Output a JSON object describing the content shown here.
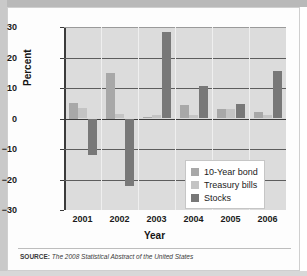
{
  "figure": {
    "source_prefix": "SOURCE:",
    "source_text": "The 2008 Statistical Abstract of the United States"
  },
  "chart_data": {
    "type": "bar",
    "title": "",
    "xlabel": "Year",
    "ylabel": "Percent",
    "categories": [
      "2001",
      "2002",
      "2003",
      "2004",
      "2005",
      "2006"
    ],
    "ylim": [
      -30,
      30
    ],
    "yticks": [
      30,
      20,
      10,
      0,
      -10,
      -20,
      -30
    ],
    "ytick_labels": [
      "30",
      "20",
      "10",
      "0",
      "−10",
      "−20",
      "−30"
    ],
    "grid": true,
    "legend_position": "inside-lower-right",
    "series": [
      {
        "name": "10-Year bond",
        "color": "#a8a8a8",
        "values": [
          5.0,
          15.0,
          0.5,
          4.5,
          3.0,
          2.0
        ]
      },
      {
        "name": "Treasury bills",
        "color": "#c4c4c4",
        "values": [
          3.4,
          1.6,
          1.0,
          1.2,
          3.0,
          1.0
        ]
      },
      {
        "name": "Stocks",
        "color": "#787878",
        "values": [
          -12.0,
          -22.2,
          28.5,
          10.8,
          4.8,
          15.5
        ]
      }
    ]
  }
}
